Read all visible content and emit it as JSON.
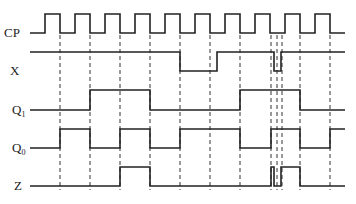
{
  "signals": [
    {
      "name": "CP",
      "label": "CP",
      "sub": "",
      "y_high": 14,
      "y_low": 33
    },
    {
      "name": "X",
      "label": "X",
      "sub": "",
      "y_high": 52,
      "y_low": 71
    },
    {
      "name": "Q1",
      "label": "Q",
      "sub": "1",
      "y_high": 90,
      "y_low": 110
    },
    {
      "name": "Q0",
      "label": "Q",
      "sub": "0",
      "y_high": 129,
      "y_low": 148
    },
    {
      "name": "Z",
      "label": "Z",
      "sub": "",
      "y_high": 167,
      "y_low": 186
    }
  ],
  "waveforms": {
    "CP": {
      "start": 30,
      "end": 345,
      "initial": 0,
      "transitions": [
        45,
        60,
        75,
        90,
        105,
        120,
        135,
        150,
        165,
        180,
        195,
        210,
        225,
        240,
        255,
        270,
        285,
        300,
        315,
        330
      ]
    },
    "X": {
      "start": 30,
      "end": 345,
      "initial": 1,
      "transitions": [
        180,
        217,
        274,
        281
      ]
    },
    "Q1": {
      "start": 30,
      "end": 345,
      "initial": 0,
      "transitions": [
        90,
        150,
        240,
        300
      ]
    },
    "Q0": {
      "start": 30,
      "end": 345,
      "initial": 0,
      "transitions": [
        60,
        90,
        120,
        150,
        180,
        240,
        271,
        300,
        330
      ]
    },
    "Z": {
      "start": 30,
      "end": 345,
      "initial": 0,
      "transitions": [
        120,
        150,
        271,
        274,
        281,
        300
      ]
    }
  },
  "dashed_lines": {
    "x": [
      60,
      90,
      120,
      150,
      180,
      210,
      240,
      271,
      277,
      282,
      300,
      330
    ],
    "y_top": 35,
    "y_bottom": 190
  }
}
